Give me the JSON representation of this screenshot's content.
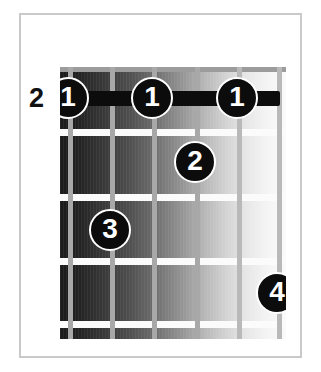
{
  "diagram": {
    "type": "guitar-chord-diagram",
    "title": "",
    "starting_fret_label": "2",
    "string_count": 6,
    "fret_count": 4,
    "colors": {
      "background": "#ffffff",
      "frame": "#c9c9c9",
      "string": "#a8a8a8",
      "fret": "#fbfbfb",
      "marker": "#0c0c0c",
      "marker_text": "#ffffff",
      "board_dark": "#1a1a1a",
      "board_light": "#fbfbfb"
    },
    "strings": [
      {
        "index": 1,
        "x": 8
      },
      {
        "index": 2,
        "x": 50
      },
      {
        "index": 3,
        "x": 92
      },
      {
        "index": 4,
        "x": 135
      },
      {
        "index": 5,
        "x": 177
      },
      {
        "index": 6,
        "x": 217
      }
    ],
    "frets": [
      {
        "index": 0,
        "y": 0,
        "is_nut": true
      },
      {
        "index": 1,
        "y": 62
      },
      {
        "index": 2,
        "y": 127
      },
      {
        "index": 3,
        "y": 191
      },
      {
        "index": 4,
        "y": 254
      }
    ],
    "barre": {
      "label": "1",
      "fret": 1,
      "from_string": 1,
      "to_string": 5,
      "x": 10,
      "y": 24,
      "width": 210
    },
    "markers": [
      {
        "label": "1",
        "finger": 1,
        "string": 1,
        "fret": 1,
        "x": -13,
        "y": 10
      },
      {
        "label": "1",
        "finger": 1,
        "string": 3,
        "fret": 1,
        "x": 71,
        "y": 10
      },
      {
        "label": "1",
        "finger": 1,
        "string": 5,
        "fret": 1,
        "x": 156,
        "y": 10
      },
      {
        "label": "2",
        "finger": 2,
        "string": 4,
        "fret": 2,
        "x": 114,
        "y": 74
      },
      {
        "label": "3",
        "finger": 3,
        "string": 2,
        "fret": 3,
        "x": 29,
        "y": 142
      },
      {
        "label": "4",
        "finger": 4,
        "string": 6,
        "fret": 4,
        "x": 196,
        "y": 205
      }
    ]
  }
}
